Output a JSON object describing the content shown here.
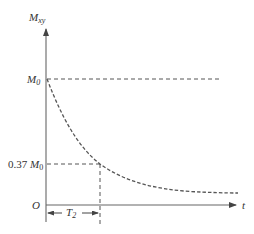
{
  "diagram": {
    "y_axis_label": "M",
    "y_axis_label_sub": "xy",
    "x_axis_label": "t",
    "origin_label": "O",
    "m0_label": "M",
    "m0_label_sub": "0",
    "level_label_prefix": "0.37 ",
    "level_label": "M",
    "level_label_sub": "0",
    "interval_label": "T",
    "interval_label_sub": "2",
    "curve": "exponential decay M0·e^(-t/T2)",
    "colors": {
      "axis": "#555555",
      "dashed": "#555555",
      "text": "#333333"
    }
  }
}
